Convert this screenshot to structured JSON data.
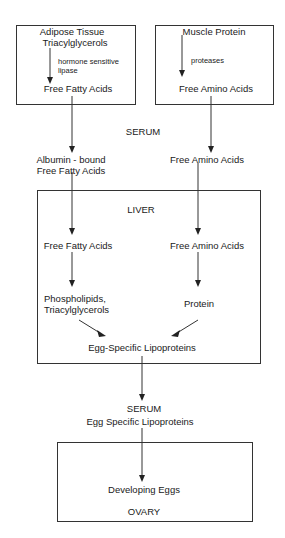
{
  "diagram": {
    "type": "flowchart",
    "line_color": "#333333",
    "boxes": {
      "adipose": {
        "line1": "Adipose Tissue",
        "line2": "Triacylglycerols",
        "enzyme_line1": "hormone sensitive",
        "enzyme_line2": "lipase",
        "product": "Free Fatty Acids"
      },
      "muscle": {
        "line1": "Muscle Protein",
        "enzyme": "proteases",
        "product": "Free Amino Acids"
      },
      "liver": {
        "label": "LIVER",
        "left_1": "Free Fatty Acids",
        "right_1": "Free Amino Acids",
        "left_2_line1": "Phospholipids,",
        "left_2_line2": "Triacylglycerols",
        "right_2": "Protein",
        "output": "Egg-Specific Lipoproteins"
      },
      "ovary": {
        "product": "Developing Eggs",
        "label": "OVARY"
      }
    },
    "serum_1": {
      "label": "SERUM",
      "left_line1": "Albumin - bound",
      "left_line2": "Free Fatty Acids",
      "right": "Free Amino Acids"
    },
    "serum_2": {
      "label": "SERUM",
      "content": "Egg Specific Lipoproteins"
    }
  }
}
